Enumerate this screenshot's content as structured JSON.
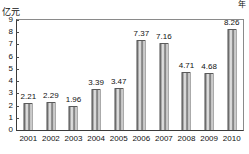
{
  "title_strip": "",
  "axis": {
    "y_unit": "亿元",
    "x_unit": "年",
    "y_ticks": [
      "0",
      "1",
      "2",
      "3",
      "4",
      "5",
      "6",
      "7",
      "8",
      "9"
    ]
  },
  "chart_data": {
    "type": "bar",
    "title": "",
    "xlabel": "年",
    "ylabel": "亿元",
    "ylim": [
      0,
      9
    ],
    "grid": false,
    "legend": "none",
    "categories": [
      "2001",
      "2002",
      "2003",
      "2004",
      "2005",
      "2006",
      "2007",
      "2008",
      "2009",
      "2010"
    ],
    "values": [
      2.21,
      2.29,
      1.96,
      3.39,
      3.47,
      7.37,
      7.16,
      4.71,
      4.68,
      8.26
    ],
    "data_labels": [
      "2.21",
      "2.29",
      "1.96",
      "3.39",
      "3.47",
      "7.37",
      "7.16",
      "4.71",
      "4.68",
      "8.26"
    ]
  },
  "colors": {
    "bar_dark": "#4a4a4a",
    "bar_light": "#f2f2f2",
    "axis": "#3a3a3a",
    "text": "#111111"
  }
}
